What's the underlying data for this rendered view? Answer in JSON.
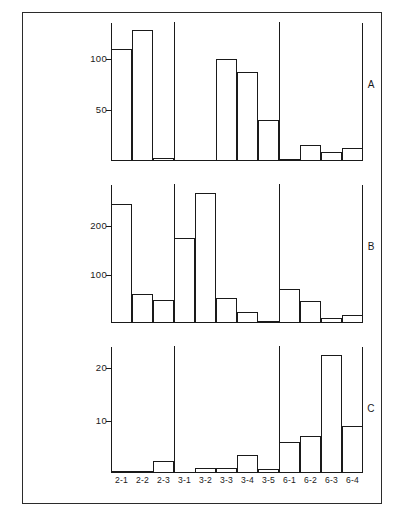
{
  "figure": {
    "panel_letters": [
      "A",
      "B",
      "C"
    ]
  },
  "chart_data": {
    "type": "bar",
    "title": "",
    "subtitle": "",
    "xlabel": "",
    "ylabel": "",
    "grid": false,
    "legend": null,
    "categories": [
      "2-1",
      "2-2",
      "2-3",
      "3-1",
      "3-2",
      "3-3",
      "3-4",
      "3-5",
      "6-1",
      "6-2",
      "6-3",
      "6-4"
    ],
    "group_separators_after": [
      "2-3",
      "3-5"
    ],
    "panels": [
      {
        "label": "A",
        "ylim": [
          0,
          135
        ],
        "yticks": [
          50,
          100
        ],
        "ytick_labels": [
          "50",
          "100"
        ],
        "values": [
          110,
          128,
          3,
          1,
          1,
          100,
          87,
          40,
          2,
          16,
          9,
          13
        ]
      },
      {
        "label": "B",
        "ylim": [
          0,
          285
        ],
        "yticks": [
          100,
          200
        ],
        "ytick_labels": [
          "100",
          "200"
        ],
        "values": [
          245,
          60,
          48,
          175,
          268,
          52,
          22,
          4,
          70,
          45,
          10,
          17
        ]
      },
      {
        "label": "C",
        "ylim": [
          0,
          24
        ],
        "yticks": [
          10,
          20
        ],
        "ytick_labels": [
          "10",
          "20"
        ],
        "values": [
          0.3,
          0.3,
          2.3,
          0.1,
          1.0,
          1.0,
          3.5,
          0.8,
          6.0,
          7.0,
          22.5,
          9.0
        ]
      }
    ]
  }
}
